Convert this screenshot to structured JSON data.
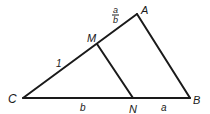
{
  "diagram": {
    "type": "triangle",
    "points": {
      "C": {
        "label": "C"
      },
      "A": {
        "label": "A"
      },
      "B": {
        "label": "B"
      },
      "M": {
        "label": "M"
      },
      "N": {
        "label": "N"
      }
    },
    "segments": [
      {
        "from": "C",
        "to": "A"
      },
      {
        "from": "A",
        "to": "B"
      },
      {
        "from": "C",
        "to": "B"
      },
      {
        "from": "M",
        "to": "N"
      }
    ],
    "edge_labels": {
      "CM": "1",
      "MA_num": "a",
      "MA_den": "b",
      "CN": "b",
      "NB": "a"
    },
    "stroke_color": "#1a1a1a"
  }
}
